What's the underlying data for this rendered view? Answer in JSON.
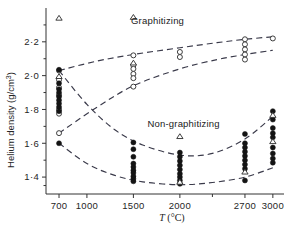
{
  "chart_data": {
    "type": "scatter",
    "title": "",
    "xlabel": "T (°C)",
    "ylabel": "Helium density (g/cm³)",
    "xlim": [
      560,
      3120
    ],
    "ylim": [
      1.3,
      2.4
    ],
    "xticks": [
      700,
      1000,
      1500,
      2000,
      2700,
      3000
    ],
    "xticklabels": [
      "700",
      "1000",
      "1500",
      "2000",
      "2700",
      "3000"
    ],
    "yticks": [
      2.2,
      2.0,
      1.8,
      1.6,
      1.4
    ],
    "yticklabels": [
      "2·2",
      "2·0",
      "1·8",
      "1·6",
      "1·4"
    ],
    "yminorticks": [
      2.3,
      2.1,
      1.9,
      1.7,
      1.5,
      1.35
    ],
    "grid": false,
    "legend": "none",
    "annotations": [
      {
        "text": "Graphitizing",
        "x": 1760,
        "y": 2.305
      },
      {
        "text": "Non-graphitizing",
        "x": 2040,
        "y": 1.695
      }
    ],
    "series": [
      {
        "name": "Graphitizing (open circles)",
        "marker": "open-circle",
        "points": [
          {
            "x": 700,
            "y": 2.03
          },
          {
            "x": 700,
            "y": 1.975
          },
          {
            "x": 700,
            "y": 1.93
          },
          {
            "x": 700,
            "y": 1.885
          },
          {
            "x": 700,
            "y": 1.8
          },
          {
            "x": 700,
            "y": 1.775
          },
          {
            "x": 700,
            "y": 1.66
          },
          {
            "x": 1500,
            "y": 2.12
          },
          {
            "x": 1500,
            "y": 2.06
          },
          {
            "x": 1500,
            "y": 2.04
          },
          {
            "x": 1500,
            "y": 2.01
          },
          {
            "x": 1500,
            "y": 1.985
          },
          {
            "x": 1500,
            "y": 1.935
          },
          {
            "x": 2000,
            "y": 2.14
          },
          {
            "x": 2000,
            "y": 2.11
          },
          {
            "x": 2700,
            "y": 2.215
          },
          {
            "x": 2700,
            "y": 2.185
          },
          {
            "x": 2700,
            "y": 2.155
          },
          {
            "x": 2700,
            "y": 2.125
          },
          {
            "x": 2700,
            "y": 2.095
          },
          {
            "x": 3000,
            "y": 2.22
          }
        ]
      },
      {
        "name": "Graphitizing (open triangles)",
        "marker": "open-triangle",
        "points": [
          {
            "x": 700,
            "y": 2.34
          },
          {
            "x": 700,
            "y": 1.995
          },
          {
            "x": 1500,
            "y": 2.345
          },
          {
            "x": 1500,
            "y": 2.075
          }
        ]
      },
      {
        "name": "Non-graphitizing (filled circles)",
        "marker": "filled-circle",
        "points": [
          {
            "x": 700,
            "y": 2.035
          },
          {
            "x": 700,
            "y": 1.955
          },
          {
            "x": 700,
            "y": 1.92
          },
          {
            "x": 700,
            "y": 1.9
          },
          {
            "x": 700,
            "y": 1.875
          },
          {
            "x": 700,
            "y": 1.855
          },
          {
            "x": 700,
            "y": 1.835
          },
          {
            "x": 700,
            "y": 1.815
          },
          {
            "x": 700,
            "y": 1.79
          },
          {
            "x": 700,
            "y": 1.6
          },
          {
            "x": 1500,
            "y": 1.605
          },
          {
            "x": 1500,
            "y": 1.565
          },
          {
            "x": 1500,
            "y": 1.52
          },
          {
            "x": 1500,
            "y": 1.48
          },
          {
            "x": 1500,
            "y": 1.46
          },
          {
            "x": 1500,
            "y": 1.44
          },
          {
            "x": 1500,
            "y": 1.425
          },
          {
            "x": 1500,
            "y": 1.405
          },
          {
            "x": 1500,
            "y": 1.39
          },
          {
            "x": 1500,
            "y": 1.375
          },
          {
            "x": 2000,
            "y": 1.545
          },
          {
            "x": 2000,
            "y": 1.52
          },
          {
            "x": 2000,
            "y": 1.495
          },
          {
            "x": 2000,
            "y": 1.47
          },
          {
            "x": 2000,
            "y": 1.445
          },
          {
            "x": 2000,
            "y": 1.42
          },
          {
            "x": 2000,
            "y": 1.4
          },
          {
            "x": 2000,
            "y": 1.38
          },
          {
            "x": 2000,
            "y": 1.36
          },
          {
            "x": 2700,
            "y": 1.655
          },
          {
            "x": 2700,
            "y": 1.6
          },
          {
            "x": 2700,
            "y": 1.575
          },
          {
            "x": 2700,
            "y": 1.55
          },
          {
            "x": 2700,
            "y": 1.525
          },
          {
            "x": 2700,
            "y": 1.5
          },
          {
            "x": 2700,
            "y": 1.475
          },
          {
            "x": 2700,
            "y": 1.45
          },
          {
            "x": 2700,
            "y": 1.38
          },
          {
            "x": 3000,
            "y": 1.79
          },
          {
            "x": 3000,
            "y": 1.74
          },
          {
            "x": 3000,
            "y": 1.69
          },
          {
            "x": 3000,
            "y": 1.66
          },
          {
            "x": 3000,
            "y": 1.635
          },
          {
            "x": 3000,
            "y": 1.575
          },
          {
            "x": 3000,
            "y": 1.54
          },
          {
            "x": 3000,
            "y": 1.51
          },
          {
            "x": 3000,
            "y": 1.485
          }
        ]
      },
      {
        "name": "Non-graphitizing (open triangles)",
        "marker": "open-triangle",
        "points": [
          {
            "x": 2000,
            "y": 1.64
          },
          {
            "x": 2000,
            "y": 1.37
          },
          {
            "x": 2700,
            "y": 1.43
          },
          {
            "x": 3000,
            "y": 1.765
          },
          {
            "x": 3000,
            "y": 1.61
          }
        ]
      }
    ],
    "curves": [
      {
        "name": "graphitizing-upper-bound",
        "style": "dashed",
        "points": [
          {
            "x": 700,
            "y": 2.03
          },
          {
            "x": 1100,
            "y": 2.085
          },
          {
            "x": 1500,
            "y": 2.125
          },
          {
            "x": 2000,
            "y": 2.165
          },
          {
            "x": 2400,
            "y": 2.195
          },
          {
            "x": 2700,
            "y": 2.215
          },
          {
            "x": 3000,
            "y": 2.23
          }
        ]
      },
      {
        "name": "graphitizing-lower-bound",
        "style": "dashed",
        "points": [
          {
            "x": 700,
            "y": 1.66
          },
          {
            "x": 1100,
            "y": 1.81
          },
          {
            "x": 1500,
            "y": 1.94
          },
          {
            "x": 2000,
            "y": 2.04
          },
          {
            "x": 2400,
            "y": 2.095
          },
          {
            "x": 2700,
            "y": 2.125
          },
          {
            "x": 3000,
            "y": 2.15
          }
        ]
      },
      {
        "name": "non-graphitizing-upper-bound",
        "style": "dashed",
        "points": [
          {
            "x": 700,
            "y": 2.03
          },
          {
            "x": 1000,
            "y": 1.83
          },
          {
            "x": 1300,
            "y": 1.68
          },
          {
            "x": 1600,
            "y": 1.59
          },
          {
            "x": 2000,
            "y": 1.53
          },
          {
            "x": 2350,
            "y": 1.54
          },
          {
            "x": 2700,
            "y": 1.625
          },
          {
            "x": 3000,
            "y": 1.76
          }
        ]
      },
      {
        "name": "non-graphitizing-lower-bound",
        "style": "dashed",
        "points": [
          {
            "x": 700,
            "y": 1.6
          },
          {
            "x": 1000,
            "y": 1.48
          },
          {
            "x": 1300,
            "y": 1.41
          },
          {
            "x": 1600,
            "y": 1.372
          },
          {
            "x": 2000,
            "y": 1.355
          },
          {
            "x": 2350,
            "y": 1.368
          },
          {
            "x": 2700,
            "y": 1.4
          },
          {
            "x": 3000,
            "y": 1.455
          }
        ]
      }
    ]
  }
}
